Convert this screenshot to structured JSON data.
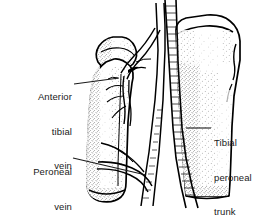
{
  "figure": {
    "type": "anatomical-line-drawing",
    "style": "black and white stippled pen-and-ink medical illustration",
    "background_color": "#ffffff",
    "ink_color": "#000000",
    "text_color": "#1a1a1a"
  },
  "labels": {
    "anterior_tibial_vein": {
      "lines": [
        "Anterior",
        "tibial",
        "vein"
      ],
      "text": "Anterior tibial vein",
      "align": "right",
      "leader_from": [
        74,
        84
      ],
      "leader_to": [
        119,
        78
      ]
    },
    "peroneal_vein": {
      "lines": [
        "Peroneal",
        "vein"
      ],
      "text": "Peroneal vein",
      "align": "right",
      "leader_from": [
        73,
        158
      ],
      "leader_to": [
        146,
        175
      ]
    },
    "tibial_peroneal_trunk": {
      "lines": [
        "Tibial",
        "peroneal",
        "trunk"
      ],
      "text": "Tibial peroneal trunk",
      "align": "left",
      "leader_from": [
        211,
        128
      ],
      "leader_to": [
        186,
        128
      ]
    }
  },
  "structures": {
    "fibula": {
      "name": "Fibula",
      "side": "left",
      "description": "slender lateral bone, head at top, shaft descending, cut off at lower end"
    },
    "tibia": {
      "name": "Tibia",
      "side": "right",
      "description": "large medial bone with condyle and tuberosity, shaft cut off at lower end"
    },
    "vessels": [
      {
        "name": "Anterior tibial vein",
        "description": "branching vessel crossing the fibular head region"
      },
      {
        "name": "Peroneal vein",
        "description": "vessel crossing the fibular shaft obliquely"
      },
      {
        "name": "Tibial peroneal trunk",
        "description": "long vertical trunk running between the bones"
      }
    ]
  }
}
